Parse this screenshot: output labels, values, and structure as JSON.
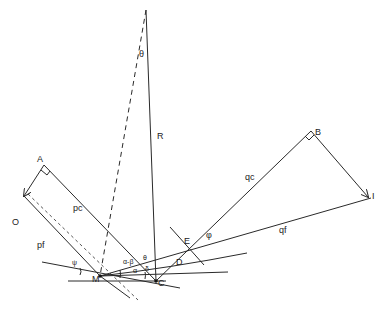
{
  "diagram": {
    "points": {
      "top": "",
      "A": "A",
      "O": "O",
      "M": "M",
      "C": "C",
      "D": "D",
      "E": "E",
      "B": "B",
      "I": "I"
    },
    "segment_labels": {
      "R": "R",
      "theta": "θ",
      "pc": "pc",
      "pf": "pf",
      "qc": "qc",
      "qf": "qf",
      "phi": "φ",
      "psi": "ψ",
      "alpha_beta": "α-β",
      "alpha": "α",
      "beta": "β",
      "delta": "δ",
      "theta_small": "θ"
    }
  }
}
